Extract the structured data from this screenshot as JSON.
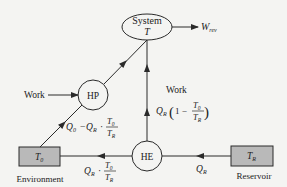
{
  "diagram": {
    "colors": {
      "background": "#f4f4f2",
      "line": "#2a2a2a",
      "box_fill": "#b9b9b9"
    },
    "nodes": {
      "system": {
        "label": "System",
        "sublabel": "T",
        "shape": "ellipse"
      },
      "hp": {
        "label": "HP",
        "shape": "circle"
      },
      "he": {
        "label": "HE",
        "shape": "circle"
      },
      "environment": {
        "label": "T",
        "subscript": "0",
        "caption": "Environment",
        "shape": "box"
      },
      "reservoir": {
        "label": "T",
        "subscript": "R",
        "caption": "Reservoir",
        "shape": "box"
      }
    },
    "edges": {
      "w_rev": {
        "label": "W",
        "subscript": "rev"
      },
      "work_in_hp": {
        "label": "Work"
      },
      "work_he": {
        "label": "Work",
        "expr_q": "Q",
        "expr_q_sub": "R",
        "expr_one_minus": "1 −",
        "frac_num": "T",
        "frac_num_sub": "0",
        "frac_den": "T",
        "frac_den_sub": "R"
      },
      "env_to_hp": {
        "q0": "Q",
        "q0_sub": "0",
        "minus": "−",
        "qr": "Q",
        "qr_sub": "R",
        "dot": "·",
        "frac_num": "T",
        "frac_num_sub": "0",
        "frac_den": "T",
        "frac_den_sub": "R"
      },
      "he_to_env": {
        "qr": "Q",
        "qr_sub": "R",
        "dot": "·",
        "frac_num": "T",
        "frac_num_sub": "0",
        "frac_den": "T",
        "frac_den_sub": "R"
      },
      "res_to_he": {
        "label": "Q",
        "subscript": "R"
      }
    }
  }
}
